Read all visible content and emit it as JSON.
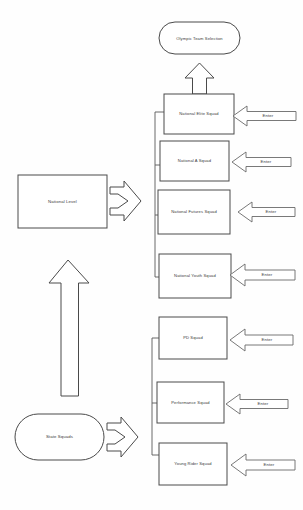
{
  "diagram": {
    "title_node": {
      "label": "Olympic Team Selection",
      "shape": "rounded-rectangle"
    },
    "left_nodes": [
      {
        "id": "national-level",
        "label": "National Level",
        "shape": "rectangle"
      },
      {
        "id": "state-squads",
        "label": "State Squads",
        "shape": "stadium"
      }
    ],
    "national_squads": [
      {
        "id": "national-elite-squad",
        "label": "National Elite Squad"
      },
      {
        "id": "national-a-squad",
        "label": "National A Squad"
      },
      {
        "id": "national-futures-squad",
        "label": "National Futures  Squad"
      },
      {
        "id": "national-youth-squad",
        "label": "National Youth Squad"
      }
    ],
    "state_squads": [
      {
        "id": "pd-squad",
        "label": "PD Squad"
      },
      {
        "id": "performance-squad",
        "label": "Performance Squad"
      },
      {
        "id": "young-rider-squad",
        "label": "Young Rider Squad"
      }
    ],
    "entry_arrows": [
      {
        "id": "enter-national-elite",
        "label": "Enter"
      },
      {
        "id": "enter-national-a",
        "label": "Enter"
      },
      {
        "id": "enter-national-futures",
        "label": "Enter"
      },
      {
        "id": "enter-national-youth",
        "label": "Enter"
      },
      {
        "id": "enter-pd",
        "label": "Enter"
      },
      {
        "id": "enter-performance",
        "label": "Enter"
      },
      {
        "id": "enter-young-rider",
        "label": "Enter"
      }
    ],
    "flow_arrows": [
      {
        "id": "national-level-to-squads",
        "direction": "right",
        "style": "chevron"
      },
      {
        "id": "state-squads-to-squads",
        "direction": "right",
        "style": "chevron"
      },
      {
        "id": "state-to-national-level",
        "direction": "up",
        "style": "block"
      },
      {
        "id": "elite-to-olympic",
        "direction": "up",
        "style": "block"
      }
    ],
    "colors": {
      "stroke": "#4a4a4a",
      "background": "#fefefe",
      "text": "#3a3a3a"
    }
  }
}
